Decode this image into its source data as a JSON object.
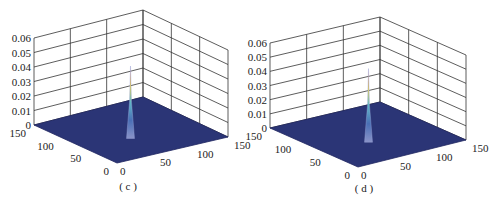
{
  "chart_data": [
    {
      "type": "surface3d",
      "label": "( c )",
      "title": "",
      "xlabel": "",
      "ylabel": "",
      "zlabel": "",
      "x_ticks": [
        "0",
        "50",
        "100",
        "150"
      ],
      "y_ticks": [
        "0",
        "50",
        "100",
        "150"
      ],
      "z_ticks": [
        "0",
        "0.01",
        "0.02",
        "0.03",
        "0.04",
        "0.05",
        "0.06"
      ],
      "xlim": [
        0,
        150
      ],
      "ylim": [
        0,
        150
      ],
      "zlim": [
        0,
        0.06
      ],
      "peak": {
        "x": 75,
        "y": 75,
        "z": 0.05
      },
      "description": "Flat surface near zero with a single sharp narrow peak at the center reaching ~0.05",
      "grid": true
    },
    {
      "type": "surface3d",
      "label": "( d )",
      "title": "",
      "xlabel": "",
      "ylabel": "",
      "zlabel": "",
      "x_ticks": [
        "0",
        "50",
        "100",
        "150"
      ],
      "y_ticks": [
        "0",
        "50",
        "100",
        "150"
      ],
      "z_ticks": [
        "0",
        "0.01",
        "0.02",
        "0.03",
        "0.04",
        "0.05",
        "0.06"
      ],
      "xlim": [
        0,
        150
      ],
      "ylim": [
        0,
        150
      ],
      "zlim": [
        0,
        0.06
      ],
      "peak": {
        "x": 75,
        "y": 75,
        "z": 0.052
      },
      "description": "Flat surface near zero with a single sharp narrow peak at the center reaching ~0.052",
      "grid": true
    }
  ],
  "colors": {
    "floor": "#2b3576",
    "grid": "#333333",
    "peak_top": "#c0392b",
    "peak_mid": "#e8d34a",
    "peak_low": "#5fb8c8",
    "peak_base": "#4a6fb5"
  }
}
